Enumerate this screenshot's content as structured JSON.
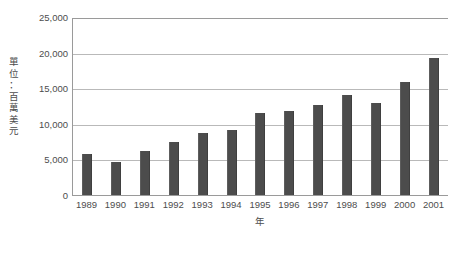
{
  "chart_data": {
    "type": "bar",
    "title": "",
    "subtitle": "",
    "xlabel": "年",
    "ylabel": "單位：百萬美元",
    "categories": [
      "1989",
      "1990",
      "1991",
      "1992",
      "1993",
      "1994",
      "1995",
      "1996",
      "1997",
      "1998",
      "1999",
      "2000",
      "2001"
    ],
    "values": [
      5700,
      4700,
      6200,
      7400,
      8700,
      9200,
      11500,
      11800,
      12600,
      14100,
      12900,
      15900,
      19200
    ],
    "ylim": [
      0,
      25000
    ],
    "ytick_values": [
      0,
      5000,
      10000,
      15000,
      20000,
      25000
    ],
    "ytick_labels": [
      "0",
      "5,000",
      "10,000",
      "15,000",
      "20,000",
      "25,000"
    ],
    "grid": true,
    "legend": false,
    "legend_position": "none",
    "bar_color": "#4c4c4c",
    "gridline_color": "#b9b9b9",
    "axis_color": "#9a9a9a",
    "background_color": "#ffffff"
  },
  "axes": {
    "y_title_vertical_text": "單\n位\n：\n百\n萬\n美\n元",
    "x_title": "年",
    "zero_label": "0"
  }
}
